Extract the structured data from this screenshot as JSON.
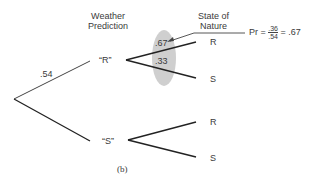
{
  "headers": {
    "prediction": [
      "Weather",
      "Prediction"
    ],
    "nature": [
      "State of",
      "Nature"
    ]
  },
  "root_branch_prob": ".54",
  "predictions": [
    {
      "label": "“R”",
      "outcomes": [
        {
          "label": "R",
          "prob": ".67"
        },
        {
          "label": "S",
          "prob": ".33"
        }
      ]
    },
    {
      "label": "“S”",
      "outcomes": [
        {
          "label": "R"
        },
        {
          "label": "S"
        }
      ]
    }
  ],
  "annotation": {
    "prefix": "Pr =",
    "numerator": ".36",
    "denominator": ".54",
    "suffix": "= .67"
  },
  "caption": "(b)",
  "colors": {
    "line": "#222222",
    "highlight": "#cfcfcf"
  }
}
